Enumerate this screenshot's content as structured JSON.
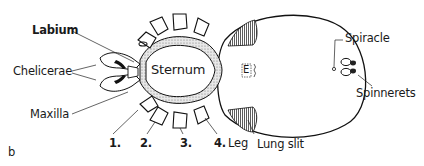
{
  "figure": {
    "panel_label": "b",
    "center_label": "Sternum",
    "epigyne_label": "E",
    "labels": {
      "labium": "Labium",
      "chelicerae": "Chelicerae",
      "maxilla": "Maxilla",
      "spiracle": "Spiracle",
      "spinnerets": "Spinnerets",
      "lung_slit": "Lung slit",
      "leg": "Leg"
    },
    "leg_numbers": [
      "1.",
      "2.",
      "3.",
      "4."
    ]
  }
}
